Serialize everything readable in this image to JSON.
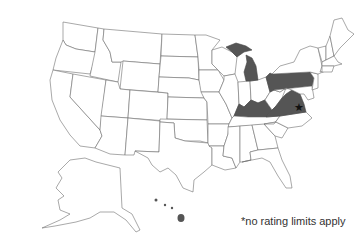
{
  "map": {
    "type": "choropleth",
    "region": "United States",
    "highlighted_states": [
      "Michigan",
      "Pennsylvania",
      "Kentucky",
      "Virginia",
      "Hawaii"
    ],
    "highlight_color": "#555555",
    "base_color": "#ffffff",
    "border_color": "#6e6e6e",
    "marker": {
      "state": "Virginia",
      "symbol": "★"
    }
  },
  "footnote": "*no rating limits apply"
}
